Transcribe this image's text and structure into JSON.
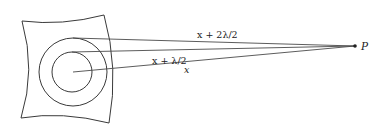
{
  "figure": {
    "labels": {
      "outer_ray": "x + 2λ/2",
      "middle_ray": "x + λ/2",
      "center_ray": "x",
      "point": "P"
    },
    "colors": {
      "stroke": "#3a3a3a",
      "text": "#222222",
      "background": "#ffffff"
    }
  }
}
